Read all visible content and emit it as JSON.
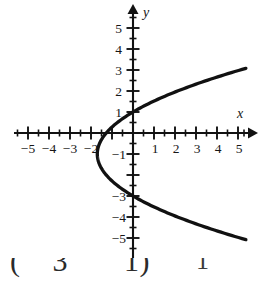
{
  "figure": {
    "title": "",
    "background_color": "#ffffff",
    "curve_color": "#111111",
    "axis_color": "#121212"
  },
  "axes": {
    "x_name": "x",
    "y_name": "y",
    "x_ticks": [
      {
        "value": -5,
        "label": "−5"
      },
      {
        "value": -4,
        "label": "−4"
      },
      {
        "value": -3,
        "label": "−3"
      },
      {
        "value": -2,
        "label": "−2"
      },
      {
        "value": 1,
        "label": "1"
      },
      {
        "value": 2,
        "label": "2"
      },
      {
        "value": 3,
        "label": "3"
      },
      {
        "value": 4,
        "label": "4"
      },
      {
        "value": 5,
        "label": "5"
      }
    ],
    "y_ticks": [
      {
        "value": 5,
        "label": "5"
      },
      {
        "value": 4,
        "label": "4"
      },
      {
        "value": 3,
        "label": "3"
      },
      {
        "value": 2,
        "label": "2"
      },
      {
        "value": 1,
        "label": "1"
      },
      {
        "value": -1,
        "label": "−1"
      },
      {
        "value": -3,
        "label": "−3"
      },
      {
        "value": -4,
        "label": "−4"
      },
      {
        "value": -5,
        "label": "−5"
      }
    ],
    "minor_tick_step": 0.5
  },
  "caption": {
    "left_fragment": "(    3       1)",
    "right_fragment": "1"
  },
  "chart_data": {
    "type": "line",
    "title": "",
    "xlabel": "x",
    "ylabel": "y",
    "xlim": [
      -5.6,
      5.6
    ],
    "ylim": [
      -5.5,
      5.6
    ],
    "grid": false,
    "legend": null,
    "orientation": "horizontal-parabola-opening-right",
    "equation": "x = 0.425(y + 1)^2 - 1.7",
    "vertex": [
      -1.7,
      -1
    ],
    "y_intercepts": [
      1.0,
      -3.0
    ],
    "x_intercept": -1.7,
    "series": [
      {
        "name": "parabola",
        "x": [
          -1.7,
          -1.53,
          -1.02,
          -0.17,
          1.02,
          2.55,
          4.43,
          5.4,
          4.43,
          2.55,
          1.02,
          -0.17,
          -1.02,
          -1.53,
          -1.7
        ],
        "y": [
          -1.0,
          -0.37,
          0.26,
          0.89,
          1.52,
          2.15,
          2.78,
          3.05,
          -4.78,
          -4.15,
          -3.52,
          -2.89,
          -2.26,
          -1.63,
          -1.0
        ]
      }
    ],
    "upper_branch": {
      "x": [
        -1.7,
        -1.53,
        -1.02,
        -0.17,
        1.02,
        2.55,
        4.43,
        5.42
      ],
      "y": [
        -1.0,
        -0.37,
        0.26,
        0.89,
        1.52,
        2.15,
        2.78,
        3.08
      ]
    },
    "lower_branch": {
      "x": [
        -1.7,
        -1.53,
        -1.02,
        -0.17,
        1.02,
        2.55,
        4.43,
        5.42
      ],
      "y": [
        -1.0,
        -1.63,
        -2.26,
        -2.89,
        -3.52,
        -4.15,
        -4.78,
        -5.08
      ]
    }
  }
}
